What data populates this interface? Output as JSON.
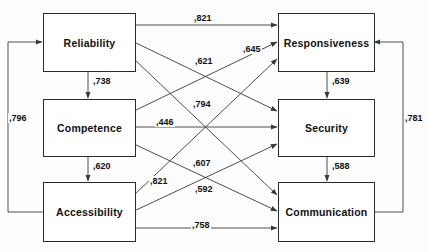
{
  "diagram": {
    "nodes": [
      {
        "id": "reliability",
        "label": "Reliability",
        "x": 43,
        "y": 13,
        "w": 91,
        "h": 57
      },
      {
        "id": "competence",
        "label": "Competence",
        "x": 43,
        "y": 99,
        "w": 91,
        "h": 56
      },
      {
        "id": "accessibility",
        "label": "Accessibility",
        "x": 43,
        "y": 182,
        "w": 91,
        "h": 58
      },
      {
        "id": "responsiveness",
        "label": "Responsiveness",
        "x": 278,
        "y": 13,
        "w": 95,
        "h": 57
      },
      {
        "id": "security",
        "label": "Security",
        "x": 278,
        "y": 99,
        "w": 95,
        "h": 56
      },
      {
        "id": "communication",
        "label": "Communication",
        "x": 278,
        "y": 182,
        "w": 95,
        "h": 58
      }
    ],
    "edges": [
      {
        "id": "e-rel-resp",
        "from": "reliability",
        "to": "responsiveness",
        "value": ",821",
        "lx": 193,
        "ly": 13,
        "bold": true
      },
      {
        "id": "e-rel-sec",
        "from": "reliability",
        "to": "security",
        "value": ",645",
        "lx": 242,
        "ly": 44,
        "bold": true
      },
      {
        "id": "e-rel-comm",
        "from": "reliability",
        "to": "communication",
        "value": ",621",
        "lx": 194,
        "ly": 56,
        "bold": true
      },
      {
        "id": "e-comp-resp",
        "from": "competence",
        "to": "responsiveness",
        "value": ",794",
        "lx": 192,
        "ly": 99,
        "bold": true
      },
      {
        "id": "e-comp-sec",
        "from": "competence",
        "to": "security",
        "value": ",446",
        "lx": 155,
        "ly": 117,
        "bold": true
      },
      {
        "id": "e-comp-comm",
        "from": "competence",
        "to": "communication",
        "value": ",607",
        "lx": 192,
        "ly": 158,
        "bold": true
      },
      {
        "id": "e-acc-resp",
        "from": "accessibility",
        "to": "responsiveness",
        "value": ",821",
        "lx": 149,
        "ly": 176,
        "bold": true
      },
      {
        "id": "e-acc-sec",
        "from": "accessibility",
        "to": "security",
        "value": ",592",
        "lx": 194,
        "ly": 184,
        "bold": true
      },
      {
        "id": "e-acc-comm",
        "from": "accessibility",
        "to": "communication",
        "value": ",758",
        "lx": 191,
        "ly": 220,
        "bold": true
      },
      {
        "id": "e-rel-comp",
        "from": "reliability",
        "to": "competence",
        "value": ",738",
        "lx": 92,
        "ly": 76,
        "bold": true
      },
      {
        "id": "e-comp-acc",
        "from": "competence",
        "to": "accessibility",
        "value": ",620",
        "lx": 92,
        "ly": 161,
        "bold": true
      },
      {
        "id": "e-resp-sec",
        "from": "responsiveness",
        "to": "security",
        "value": ",639",
        "lx": 331,
        "ly": 76,
        "bold": true
      },
      {
        "id": "e-sec-comm",
        "from": "security",
        "to": "communication",
        "value": ",588",
        "lx": 331,
        "ly": 161,
        "bold": true
      },
      {
        "id": "e-rel-acc",
        "from": "reliability",
        "to": "accessibility",
        "value": ",796",
        "lx": 8,
        "ly": 113,
        "bold": true
      },
      {
        "id": "e-resp-comm",
        "from": "responsiveness",
        "to": "communication",
        "value": ",781",
        "lx": 404,
        "ly": 113,
        "bold": true
      }
    ],
    "colors": {
      "line": "#3a3a3a",
      "box_border": "#2a2a2a",
      "text": "#111111",
      "background": "#fdfdfd"
    }
  }
}
